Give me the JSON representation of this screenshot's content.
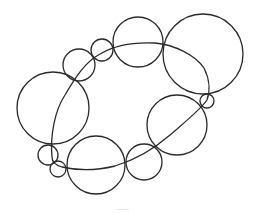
{
  "diagram": {
    "stroke_color": "#2a2a2a",
    "background": "#ffffff",
    "circles": [
      {
        "name": "left-large",
        "cx": 53,
        "cy": 108,
        "r": 36
      },
      {
        "name": "upper-left-small",
        "cx": 79,
        "cy": 65,
        "r": 16
      },
      {
        "name": "upper-small",
        "cx": 102,
        "cy": 50,
        "r": 11
      },
      {
        "name": "top",
        "cx": 138,
        "cy": 42,
        "r": 25
      },
      {
        "name": "top-right-large",
        "cx": 203,
        "cy": 54,
        "r": 40
      },
      {
        "name": "right-tiny",
        "cx": 207,
        "cy": 101,
        "r": 7
      },
      {
        "name": "mid-right",
        "cx": 177,
        "cy": 125,
        "r": 30
      },
      {
        "name": "bottom-small",
        "cx": 144,
        "cy": 162,
        "r": 18
      },
      {
        "name": "bottom",
        "cx": 96,
        "cy": 165,
        "r": 29
      },
      {
        "name": "bottom-left-small",
        "cx": 48,
        "cy": 155,
        "r": 10
      },
      {
        "name": "bottom-left-tiny",
        "cx": 58,
        "cy": 169,
        "r": 8
      }
    ],
    "curve_path": "M 52 157 C 50 135, 55 110, 65 95 C 75 78, 85 62, 100 54 C 115 45, 135 42, 155 43 C 175 45, 195 55, 204 68 C 210 80, 210 92, 207 100 C 200 110, 185 122, 170 135 C 155 148, 135 160, 115 166 C 95 171, 75 170, 62 167 C 55 165, 52 162, 52 157 Z"
  }
}
